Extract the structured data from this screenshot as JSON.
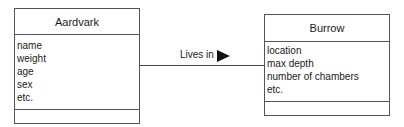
{
  "classes": [
    {
      "name": "Aardvark",
      "attributes": [
        "name",
        "weight",
        "age",
        "sex",
        "etc."
      ],
      "operations": []
    },
    {
      "name": "Burrow",
      "attributes": [
        "location",
        "max depth",
        "number of chambers",
        "etc."
      ],
      "operations": []
    }
  ],
  "association": {
    "label": "Lives in",
    "direction": "Aardvark → Burrow"
  }
}
